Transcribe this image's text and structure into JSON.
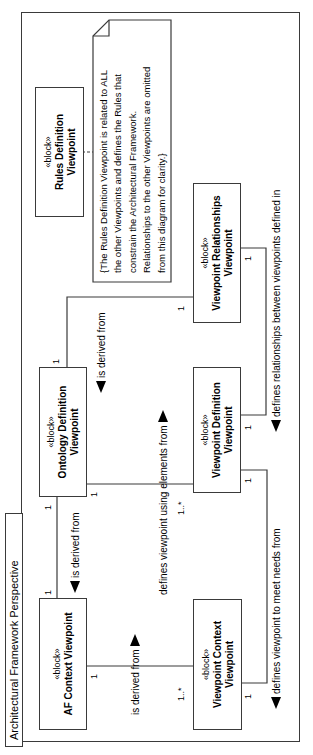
{
  "frame": {
    "title": "Architectural Framework Perspective"
  },
  "blocks": [
    {
      "id": "af-context",
      "stereotype": "«block»",
      "name_line1": "AF Context Viewpoint",
      "name_line2": ""
    },
    {
      "id": "ontology-definition",
      "stereotype": "«block»",
      "name_line1": "Ontology Definition",
      "name_line2": "Viewpoint"
    },
    {
      "id": "rules-definition",
      "stereotype": "«block»",
      "name_line1": "Rules Definition",
      "name_line2": "Viewpoint"
    },
    {
      "id": "viewpoint-context",
      "stereotype": "«block»",
      "name_line1": "Viewpoint Context",
      "name_line2": "Viewpoint"
    },
    {
      "id": "viewpoint-definition",
      "stereotype": "«block»",
      "name_line1": "Viewpoint Definition",
      "name_line2": "Viewpoint"
    },
    {
      "id": "viewpoint-relationships",
      "stereotype": "«block»",
      "name_line1": "Viewpoint Relationships",
      "name_line2": "Viewpoint"
    }
  ],
  "note": {
    "lines": [
      "{The Rules Definition Viewpoint  is related to ALL",
      "the other Viewpoints and defines the Rules that",
      "constrain the Architectural Framework.",
      "Relationships to the other Viewpoints are omitted",
      "from this diagram for clarity.}"
    ]
  },
  "edge_labels": [
    {
      "text": "is derived from",
      "arrow": "left"
    },
    {
      "text": "is derived from",
      "arrow": "left"
    },
    {
      "text": "defines viewpoint using elements from",
      "arrow": "right"
    },
    {
      "text": "is derived from",
      "arrow": "right"
    },
    {
      "text": "defines relationships between viewpoints defined in",
      "arrow": "left"
    },
    {
      "text": "defines viewpoint to meet needs from",
      "arrow": "left"
    }
  ],
  "multiplicities": [
    "1",
    "1",
    "1",
    "1",
    "1",
    "1..*",
    "1",
    "1..*",
    "1",
    "1",
    "1",
    "1"
  ],
  "colors": {
    "foreground": "#000000",
    "line": "#3a3a3a",
    "background": "#ffffff"
  }
}
